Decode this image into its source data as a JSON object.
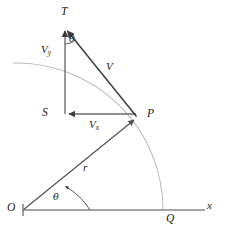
{
  "figure": {
    "type": "vector-kinematics-diagram",
    "background_color": "#ffffff",
    "stroke_dark": "#3a3a3a",
    "stroke_mid": "#6e6e6e",
    "stroke_light": "#b9b9b9",
    "labels": {
      "point_T": "T",
      "point_S": "S",
      "point_P": "P",
      "point_O": "O",
      "point_Q": "Q",
      "vector_v": "V",
      "vector_vy_base": "V",
      "vector_vy_sub": "y",
      "vector_vx_base": "V",
      "vector_vx_sub": "x",
      "angle_top": "θ",
      "angle_bottom": "θ",
      "radius": "r",
      "axis_x": "x"
    },
    "geometry": {
      "origin": [
        23,
        210
      ],
      "point_P": [
        137,
        118
      ],
      "point_S": [
        65,
        114
      ],
      "point_T": [
        65,
        28
      ],
      "point_Q": [
        163,
        210
      ],
      "x_axis_from": [
        23,
        210
      ],
      "x_axis_to": [
        205,
        210
      ],
      "arc_radius": 147,
      "arc_start": [
        13,
        63
      ],
      "arc_end": [
        163,
        210
      ]
    }
  }
}
